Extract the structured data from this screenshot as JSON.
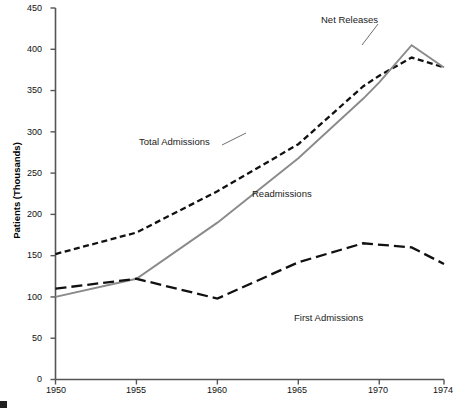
{
  "chart_data": {
    "type": "line",
    "title": "",
    "xlabel": "",
    "ylabel": "Patients (Thousands)",
    "xlim": [
      1950,
      1974
    ],
    "ylim": [
      0,
      450
    ],
    "grid": false,
    "legend_position": "inline-annotations",
    "y_ticks": [
      0,
      50,
      100,
      150,
      200,
      250,
      300,
      350,
      400,
      450
    ],
    "x_ticks": [
      1950,
      1955,
      1960,
      1965,
      1970,
      1974
    ],
    "series": [
      {
        "name": "Total Admissions",
        "style": "dashed",
        "color": "#111111",
        "x": [
          1950,
          1955,
          1960,
          1965,
          1969,
          1970,
          1972,
          1974
        ],
        "values": [
          152,
          178,
          228,
          285,
          355,
          368,
          390,
          378
        ]
      },
      {
        "name": "Net Releases",
        "style": "solid",
        "color": "#8a8a8a",
        "x": [
          1950,
          1955,
          1960,
          1965,
          1969,
          1970,
          1972,
          1974
        ],
        "values": [
          100,
          122,
          190,
          268,
          340,
          360,
          405,
          378
        ]
      },
      {
        "name": "First Admissions",
        "style": "long-dash",
        "color": "#111111",
        "x": [
          1950,
          1955,
          1960,
          1965,
          1969,
          1972,
          1974
        ],
        "values": [
          110,
          122,
          98,
          142,
          165,
          160,
          140
        ]
      }
    ],
    "annotations": [
      {
        "text": "Net Releases",
        "x_px": 321,
        "y_px": 18,
        "leader": true
      },
      {
        "text": "Total Admissions",
        "x_px": 139,
        "y_px": 140,
        "leader": true
      },
      {
        "text": "Readmissions",
        "x_px": 252,
        "y_px": 192,
        "leader": false
      },
      {
        "text": "First Admissions",
        "x_px": 294,
        "y_px": 316,
        "leader": false
      }
    ]
  },
  "axis": {
    "y_title": "Patients (Thousands)",
    "y_tick_labels": [
      "450",
      "400",
      "350",
      "300",
      "250",
      "200",
      "150",
      "100",
      "50",
      "0"
    ],
    "x_tick_labels": [
      "1950",
      "1955",
      "1960",
      "1965",
      "1970",
      "1974"
    ]
  },
  "labels": {
    "net_releases": "Net Releases",
    "total_admissions": "Total Admissions",
    "readmissions": "Readmissions",
    "first_admissions": "First Admissions"
  },
  "caption": {
    "text": ""
  },
  "colors": {
    "axis": "#555555",
    "net_releases": "#8a8a8a",
    "dark_line": "#111111",
    "text": "#111111"
  }
}
